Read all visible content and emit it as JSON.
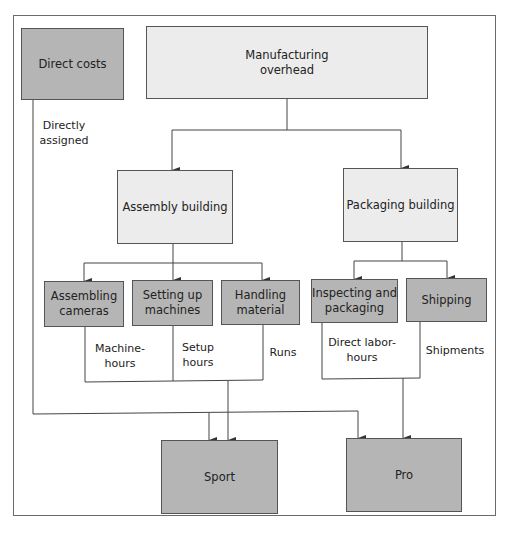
{
  "diagram": {
    "colors": {
      "cost_object_fill": "#b5b5b5",
      "overhead_fill": "#ececec",
      "activity_fill": "#b5b5b5",
      "line": "#444444"
    },
    "direct_costs": {
      "label": "Direct costs",
      "assignment_label": "Directly assigned"
    },
    "overhead": {
      "label": "Manufacturing overhead",
      "line1": "Manufacturing",
      "line2": "overhead"
    },
    "buildings": [
      {
        "label": "Assembly building"
      },
      {
        "label": "Packaging building"
      }
    ],
    "activities": [
      {
        "line1": "Assembling",
        "line2": "cameras",
        "driver1": "Machine-",
        "driver2": "hours"
      },
      {
        "line1": "Setting up",
        "line2": "machines",
        "driver1": "Setup",
        "driver2": "hours"
      },
      {
        "line1": "Handling",
        "line2": "material",
        "driver1": "Runs",
        "driver2": ""
      },
      {
        "line1": "Inspecting and",
        "line2": "packaging",
        "driver1": "Direct labor-",
        "driver2": "hours"
      },
      {
        "line1": "Shipping",
        "line2": "",
        "driver1": "Shipments",
        "driver2": ""
      }
    ],
    "products": [
      {
        "label": "Sport"
      },
      {
        "label": "Pro"
      }
    ]
  }
}
